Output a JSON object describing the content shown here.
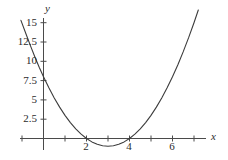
{
  "chart_data": {
    "type": "line",
    "title": "",
    "subtitle": "",
    "xlabel": "x",
    "ylabel": "y",
    "function": "y = x^2 - 6x + 8",
    "xlim": [
      -1.1,
      7.4
    ],
    "ylim": [
      -1.6,
      15.6
    ],
    "grid": false,
    "legend": null,
    "x_ticks": [
      {
        "value": 0,
        "label": ""
      },
      {
        "value": 1,
        "label": ""
      },
      {
        "value": 2,
        "label": "2"
      },
      {
        "value": 3,
        "label": ""
      },
      {
        "value": 4,
        "label": "4"
      },
      {
        "value": 5,
        "label": ""
      },
      {
        "value": 6,
        "label": "6"
      },
      {
        "value": 7,
        "label": ""
      },
      {
        "value": -1,
        "label": ""
      }
    ],
    "y_ticks": [
      {
        "value": 2.5,
        "label": "2.5"
      },
      {
        "value": 5,
        "label": "5"
      },
      {
        "value": 7.5,
        "label": "7.5"
      },
      {
        "value": 10,
        "label": "10"
      },
      {
        "value": 12.5,
        "label": "12.5"
      },
      {
        "value": 15,
        "label": "15"
      }
    ],
    "series": [
      {
        "name": "parabola",
        "color": "#3c3c3c",
        "roots": [
          2,
          4
        ],
        "vertex": [
          3,
          -1
        ],
        "y_intercept": 8,
        "x": [
          -1.05,
          -0.8,
          -0.6,
          -0.4,
          -0.2,
          0,
          0.25,
          0.5,
          0.75,
          1,
          1.25,
          1.5,
          1.75,
          2,
          2.25,
          2.5,
          2.75,
          3,
          3.25,
          3.5,
          3.75,
          4,
          4.25,
          4.5,
          4.75,
          5,
          5.25,
          5.5,
          5.75,
          6,
          6.25,
          6.5,
          6.75,
          7,
          7.2
        ],
        "y": [
          15.3,
          13.44,
          11.96,
          10.56,
          9.24,
          8,
          6.5625,
          5.25,
          4.0625,
          3,
          2.0625,
          1.25,
          0.5625,
          0,
          -0.4375,
          -0.75,
          -0.9375,
          -1,
          -0.9375,
          -0.75,
          -0.4375,
          0,
          0.5625,
          1.25,
          2.0625,
          3,
          4.0625,
          5.25,
          6.5625,
          8,
          9.5625,
          11.25,
          13.0625,
          15,
          16.64
        ]
      }
    ],
    "axis_color": "#4a4a4a",
    "curve_color": "#3c3c3c",
    "background": "#ffffff"
  }
}
